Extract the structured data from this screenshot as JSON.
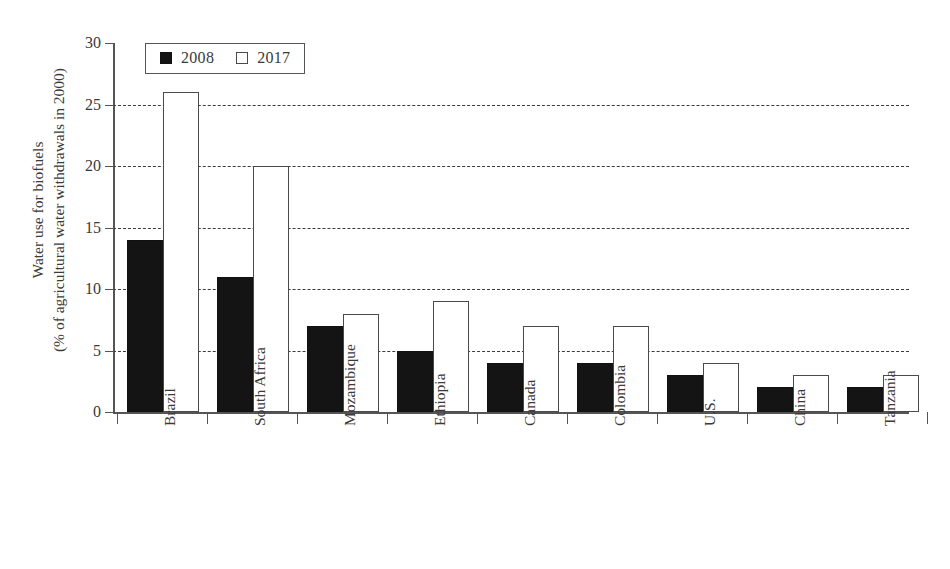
{
  "chart_data": {
    "type": "bar",
    "title": "",
    "xlabel": "",
    "ylabel_line1": "Water use for biofuels",
    "ylabel_line2": "(% of agricultural water withdrawals in 2000)",
    "ylim": [
      0,
      30
    ],
    "yticks": [
      0,
      5,
      10,
      15,
      20,
      25,
      30
    ],
    "ytick_labels": [
      "0",
      "5",
      "10",
      "15",
      "20",
      "25",
      "30"
    ],
    "grid": "horizontal-dashed",
    "legend_position": "upper-left-inside",
    "categories": [
      "Brazil",
      "South Africa",
      "Mozambique",
      "Ethiopia",
      "Canada",
      "Colombia",
      "U.S.",
      "China",
      "Tanzania",
      "Indonesia"
    ],
    "series": [
      {
        "name": "2008",
        "color": "#141414",
        "style": "filled",
        "values": [
          14,
          11,
          7,
          5,
          4,
          4,
          3,
          2,
          2,
          0
        ]
      },
      {
        "name": "2017",
        "color": "#ffffff",
        "style": "open",
        "values": [
          26,
          20,
          8,
          9,
          7,
          7,
          4,
          3,
          3,
          1.2
        ]
      }
    ]
  },
  "legend": {
    "items": [
      {
        "label": "2008",
        "swatch": "filled-square-icon"
      },
      {
        "label": "2017",
        "swatch": "open-square-icon"
      }
    ]
  }
}
